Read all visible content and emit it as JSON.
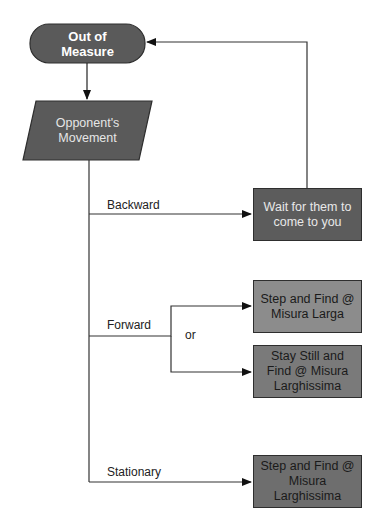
{
  "diagram": {
    "type": "flowchart",
    "nodes": {
      "start": {
        "label_line1": "Out of",
        "label_line2": "Measure",
        "shape": "terminator",
        "color": "#5a5a5a"
      },
      "input": {
        "label_line1": "Opponent's",
        "label_line2": "Movement",
        "shape": "parallelogram",
        "color": "#5a5a5a"
      },
      "wait": {
        "label_line1": "Wait for them to",
        "label_line2": "come to you",
        "shape": "process",
        "color": "#5c5c5c"
      },
      "step_larga": {
        "label_line1": "Step and Find @",
        "label_line2": "Misura Larga",
        "shape": "process",
        "color": "#8c8c8c"
      },
      "stay_still": {
        "label_line1": "Stay Still and",
        "label_line2": "Find @ Misura",
        "label_line3": "Larghissima",
        "shape": "process",
        "color": "#7a7a7a"
      },
      "step_larghissima": {
        "label_line1": "Step and Find @",
        "label_line2": "Misura",
        "label_line3": "Larghissima",
        "shape": "process",
        "color": "#6e6e6e"
      }
    },
    "edges": {
      "backward": "Backward",
      "forward": "Forward",
      "or": "or",
      "stationary": "Stationary"
    }
  }
}
